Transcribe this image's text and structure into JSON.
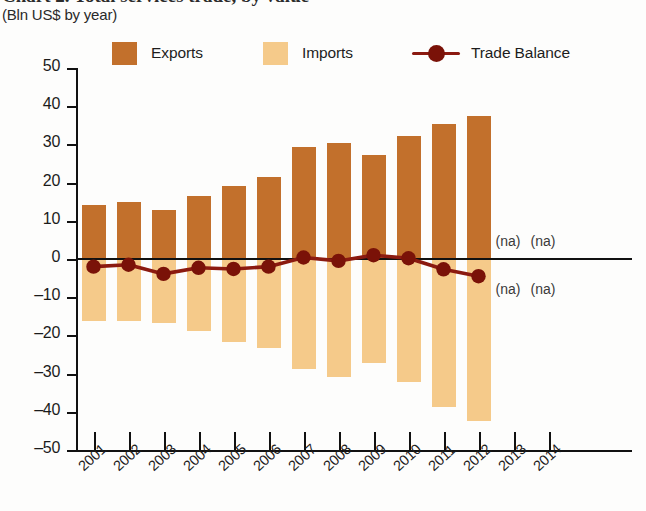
{
  "header": {
    "title": "Chart 2. Total services trade, by value",
    "subtitle": "(Bln US$ by year)"
  },
  "legend": {
    "items": [
      {
        "label": "Exports",
        "color": "#C2702C",
        "marker": "square"
      },
      {
        "label": "Imports",
        "color": "#F5CA8A",
        "marker": "square"
      },
      {
        "label": "Trade Balance",
        "color": "#8B1A10",
        "marker": "line-dot"
      }
    ]
  },
  "annotations": [
    {
      "text": "(na)",
      "year": "2013",
      "position": "above-zero"
    },
    {
      "text": "(na)",
      "year": "2014",
      "position": "above-zero"
    },
    {
      "text": "(na)",
      "year": "2013",
      "position": "below-zero"
    },
    {
      "text": "(na)",
      "year": "2014",
      "position": "below-zero"
    }
  ],
  "chart_data": {
    "type": "bar",
    "title": "Chart 2. Total services trade, by value",
    "subtitle": "(Bln US$ by year)",
    "xlabel": "",
    "ylabel": "Bln US$",
    "ylim": [
      -50,
      50
    ],
    "ytick_step": 10,
    "yticks": [
      50,
      40,
      30,
      20,
      10,
      0,
      -10,
      -20,
      -30,
      -40,
      -50
    ],
    "grid": false,
    "legend_position": "top",
    "categories": [
      "2001",
      "2002",
      "2003",
      "2004",
      "2005",
      "2006",
      "2007",
      "2008",
      "2009",
      "2010",
      "2011",
      "2012",
      "2013",
      "2014"
    ],
    "series": [
      {
        "name": "Exports",
        "type": "bar",
        "color": "#C2702C",
        "values": [
          14.2,
          14.8,
          12.8,
          16.5,
          19.2,
          21.4,
          29.2,
          30.3,
          27.2,
          32.3,
          35.4,
          37.5,
          null,
          null
        ]
      },
      {
        "name": "Imports",
        "type": "bar",
        "color": "#F5CA8A",
        "values": [
          -16.2,
          -16.3,
          -16.7,
          -18.8,
          -21.8,
          -23.4,
          -28.8,
          -30.8,
          -27.2,
          -32.1,
          -38.7,
          -42.3,
          null,
          null
        ]
      },
      {
        "name": "Trade Balance",
        "type": "line",
        "color": "#8B1A10",
        "values": [
          -2.0,
          -1.5,
          -3.9,
          -2.3,
          -2.6,
          -2.0,
          0.4,
          -0.5,
          1.0,
          0.2,
          -2.7,
          -4.5,
          null,
          null
        ]
      }
    ]
  }
}
